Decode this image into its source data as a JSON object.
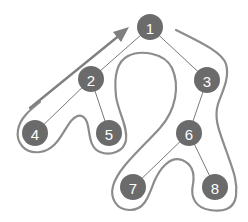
{
  "diagram": {
    "type": "binary-tree-traversal",
    "colors": {
      "node_fill": "#6b6b6b",
      "node_text": "#ffffff",
      "edge": "#7a7a7a",
      "outline": "#8c8c8c",
      "arrow": "#808080",
      "background": "#ffffff"
    },
    "nodes": [
      {
        "id": "1",
        "label": "1",
        "x": 150,
        "y": 27
      },
      {
        "id": "2",
        "label": "2",
        "x": 91,
        "y": 79
      },
      {
        "id": "3",
        "label": "3",
        "x": 207,
        "y": 80
      },
      {
        "id": "4",
        "label": "4",
        "x": 35,
        "y": 133
      },
      {
        "id": "5",
        "label": "5",
        "x": 109,
        "y": 133
      },
      {
        "id": "6",
        "label": "6",
        "x": 189,
        "y": 133
      },
      {
        "id": "7",
        "label": "7",
        "x": 133,
        "y": 187
      },
      {
        "id": "8",
        "label": "8",
        "x": 215,
        "y": 187
      }
    ],
    "edges": [
      {
        "from": "1",
        "to": "2"
      },
      {
        "from": "1",
        "to": "3"
      },
      {
        "from": "2",
        "to": "4"
      },
      {
        "from": "2",
        "to": "5"
      },
      {
        "from": "3",
        "to": "6"
      },
      {
        "from": "6",
        "to": "7"
      },
      {
        "from": "6",
        "to": "8"
      }
    ],
    "traversal_arrow": {
      "direction": "toward-root",
      "tip": {
        "x": 128,
        "y": 28
      }
    }
  }
}
